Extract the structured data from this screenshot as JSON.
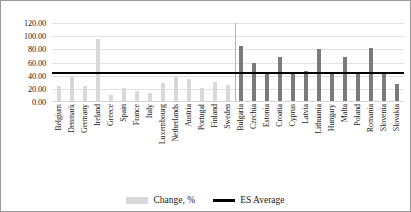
{
  "chart_data": {
    "type": "bar",
    "title": "",
    "xlabel": "",
    "ylabel": "",
    "ylim": [
      0,
      120
    ],
    "yticks": [
      "0.00",
      "20.00",
      "40.00",
      "60.00",
      "80.00",
      "100.00",
      "120.00"
    ],
    "ytick_values": [
      0,
      20,
      40,
      60,
      80,
      100,
      120
    ],
    "grid": true,
    "legend_position": "bottom",
    "categories": [
      "Belgium",
      "Denmark",
      "Germany",
      "Ireland",
      "Greece",
      "Spain",
      "France",
      "Italy",
      "Luxembourg",
      "Netherlands",
      "Austria",
      "Portugal",
      "Finland",
      "Sweden",
      "Bulgaria",
      "Czechia",
      "Estonia",
      "Croatia",
      "Cyprus",
      "Latvia",
      "Lithuania",
      "Hungary",
      "Malta",
      "Poland",
      "Romania",
      "Slovenia",
      "Slovakia"
    ],
    "series": [
      {
        "name": "Change, %",
        "color": "#d9d9d9",
        "values": [
          25,
          38,
          24,
          95,
          11,
          22,
          16,
          13,
          29,
          38,
          35,
          22,
          31,
          26,
          85,
          60,
          45,
          68,
          42,
          47,
          80,
          45,
          68,
          43,
          82,
          45,
          27
        ]
      }
    ],
    "group_colors": {
      "eu15": "#d9d9d9",
      "new_members": "#7b7b7b"
    },
    "group_split_index": 14,
    "reference_line": {
      "name": "ES Average",
      "value": 45,
      "color": "#000000"
    }
  },
  "legend": {
    "items": [
      {
        "label": "Change, %",
        "marker": "bar-swatch",
        "color": "#d9d9d9"
      },
      {
        "label": "ES Average",
        "marker": "line-swatch",
        "color": "#000000"
      }
    ]
  }
}
